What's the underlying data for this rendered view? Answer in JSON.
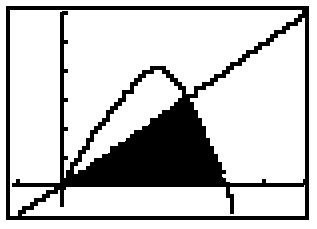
{
  "device": {
    "kind": "graphing-calculator-screen",
    "screen_label": "",
    "ink_color": "#000000",
    "screen_color": "#ffffff",
    "bezel_color": "#000000"
  },
  "frame": {
    "x": 8,
    "y": 8,
    "width": 299,
    "height": 210,
    "border_width": 4
  },
  "chart_data": {
    "type": "line",
    "title": "",
    "subtitle": "",
    "xlabel": "",
    "ylabel": "",
    "grid": false,
    "legend": "none",
    "axes": {
      "origin_px": {
        "x": 62,
        "y": 185
      },
      "x_axis": {
        "y_px": 185,
        "x_start_px": 12,
        "x_end_px": 304,
        "tick_spacing_px": 41,
        "tick_marks_px": [
          18,
          264,
          305
        ],
        "tick_length_px": 6
      },
      "y_axis": {
        "x_px": 62,
        "y_start_px": 12,
        "y_end_px": 207,
        "tick_spacing_px": 29,
        "tick_marks_px": [
          13,
          42,
          71,
          100,
          129,
          158
        ],
        "tick_length_px": 6
      },
      "xlim": [
        -1.2,
        6.0
      ],
      "ylim": [
        -0.6,
        6.0
      ],
      "x_scale_px_per_unit": 41,
      "y_scale_px_per_unit": 29
    },
    "series": [
      {
        "name": "parabola",
        "role": "upper-curve",
        "kind": "quadratic",
        "stroke": "#000000",
        "stroke_width_px": 4,
        "vertex_px": {
          "x": 145,
          "y": 68
        },
        "x_intercepts_px": [
          62,
          227
        ],
        "points_px": [
          [
            62,
            185
          ],
          [
            68,
            173
          ],
          [
            74,
            162
          ],
          [
            80,
            152
          ],
          [
            86,
            143
          ],
          [
            93,
            133
          ],
          [
            100,
            124
          ],
          [
            107,
            115
          ],
          [
            114,
            107
          ],
          [
            121,
            99
          ],
          [
            128,
            91
          ],
          [
            135,
            82
          ],
          [
            142,
            72
          ],
          [
            150,
            68
          ],
          [
            158,
            68
          ],
          [
            166,
            72
          ],
          [
            173,
            79
          ],
          [
            180,
            88
          ],
          [
            186,
            98
          ],
          [
            192,
            110
          ],
          [
            198,
            122
          ],
          [
            204,
            134
          ],
          [
            209,
            146
          ],
          [
            214,
            158
          ],
          [
            219,
            169
          ],
          [
            223,
            178
          ],
          [
            227,
            186
          ],
          [
            230,
            198
          ],
          [
            232,
            212
          ]
        ]
      },
      {
        "name": "line",
        "role": "secant-line",
        "kind": "linear",
        "stroke": "#000000",
        "stroke_width_px": 4,
        "slope_px": -0.71,
        "points_px": [
          [
            18,
            214
          ],
          [
            40,
            199
          ],
          [
            62,
            185
          ],
          [
            90,
            166
          ],
          [
            120,
            145
          ],
          [
            150,
            124
          ],
          [
            185,
            99
          ],
          [
            220,
            74
          ],
          [
            255,
            49
          ],
          [
            280,
            31
          ],
          [
            305,
            13
          ]
        ]
      }
    ],
    "shaded_region": {
      "name": "area-under-line-above-axis",
      "fill": "#000000",
      "description": "solid black region bounded above by the line, on the right by the descending parabola branch, and below by the x-axis",
      "vertices_px": [
        [
          64,
          185
        ],
        [
          185,
          99
        ],
        [
          192,
          110
        ],
        [
          198,
          122
        ],
        [
          204,
          134
        ],
        [
          209,
          146
        ],
        [
          214,
          158
        ],
        [
          219,
          169
        ],
        [
          223,
          178
        ],
        [
          226,
          185
        ]
      ]
    }
  }
}
